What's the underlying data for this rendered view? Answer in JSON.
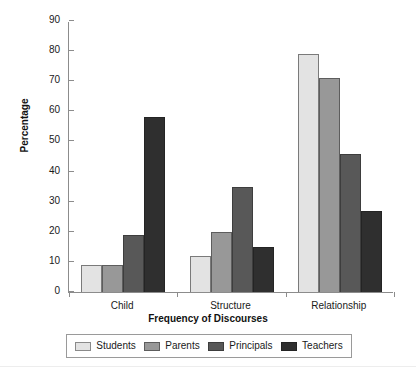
{
  "chart_data": {
    "type": "bar",
    "title": "",
    "xlabel": "Frequency of Discourses",
    "ylabel": "Percentage",
    "categories": [
      "Child",
      "Structure",
      "Relationship"
    ],
    "series": [
      {
        "name": "Students",
        "color": "#e3e3e3",
        "values": [
          9,
          12,
          79
        ]
      },
      {
        "name": "Parents",
        "color": "#989898",
        "values": [
          9,
          20,
          71
        ]
      },
      {
        "name": "Principals",
        "color": "#585858",
        "values": [
          19,
          35,
          46
        ]
      },
      {
        "name": "Teachers",
        "color": "#2f2f2f",
        "values": [
          58,
          15,
          27
        ]
      }
    ],
    "ylim": [
      0,
      90
    ],
    "yticks": [
      0,
      10,
      20,
      30,
      40,
      50,
      60,
      70,
      80,
      90
    ],
    "ytick_labels": [
      "0",
      "10",
      "20",
      "30",
      "40",
      "50",
      "60",
      "70",
      "80",
      "90"
    ],
    "grid": false,
    "legend_position": "bottom"
  }
}
